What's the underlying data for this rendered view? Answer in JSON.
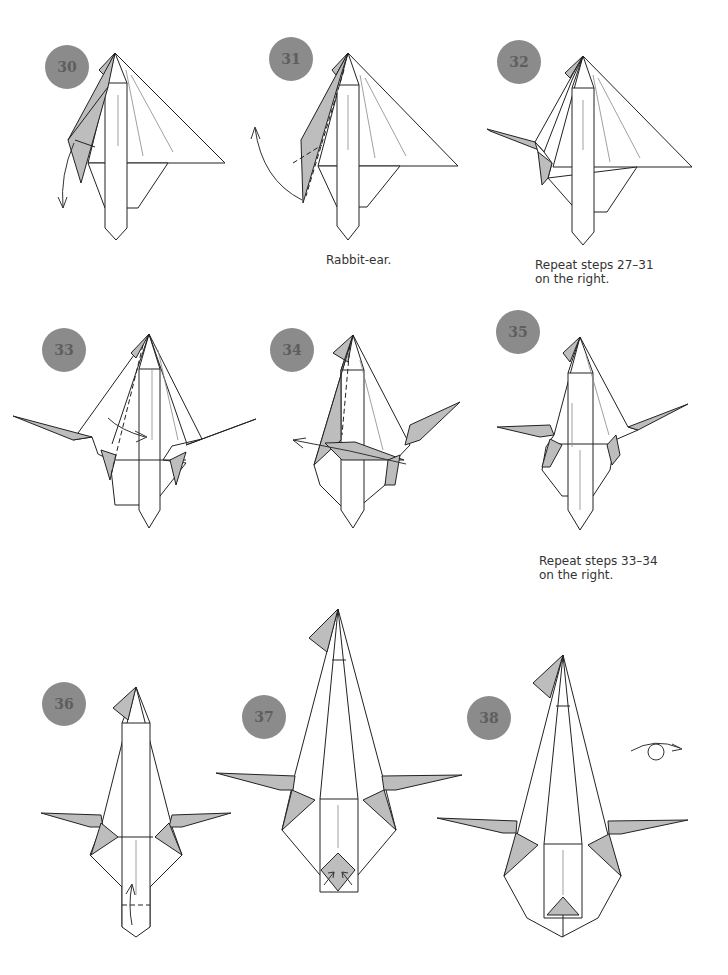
{
  "page": {
    "colors": {
      "badge_fill": "#8b8b8b",
      "badge_text": "#5e5e5e",
      "paper_color_side": "#bdbdbd",
      "paper_white_side": "#ffffff",
      "line": "#222222"
    }
  },
  "steps": [
    {
      "number": "30",
      "caption": "",
      "symbols": [
        "valley-fold-arrow-down"
      ]
    },
    {
      "number": "31",
      "caption": "Rabbit-ear.",
      "symbols": [
        "rabbit-ear-arrow",
        "valley-fold-lines"
      ]
    },
    {
      "number": "32",
      "caption": "Repeat steps 27–31\non the right.",
      "symbols": []
    },
    {
      "number": "33",
      "caption": "",
      "symbols": [
        "valley-fold-dashed-line",
        "fold-arrow-right"
      ]
    },
    {
      "number": "34",
      "caption": "",
      "symbols": [
        "valley-fold-dashed-line",
        "fold-arrow-left"
      ]
    },
    {
      "number": "35",
      "caption": "Repeat steps 33–34\non the right.",
      "symbols": []
    },
    {
      "number": "36",
      "caption": "",
      "symbols": [
        "fold-up-arrow",
        "valley-fold-dashed-line"
      ]
    },
    {
      "number": "37",
      "caption": "",
      "symbols": [
        "squash-arrows"
      ]
    },
    {
      "number": "38",
      "caption": "",
      "symbols": [
        "turn-over-symbol"
      ]
    }
  ]
}
